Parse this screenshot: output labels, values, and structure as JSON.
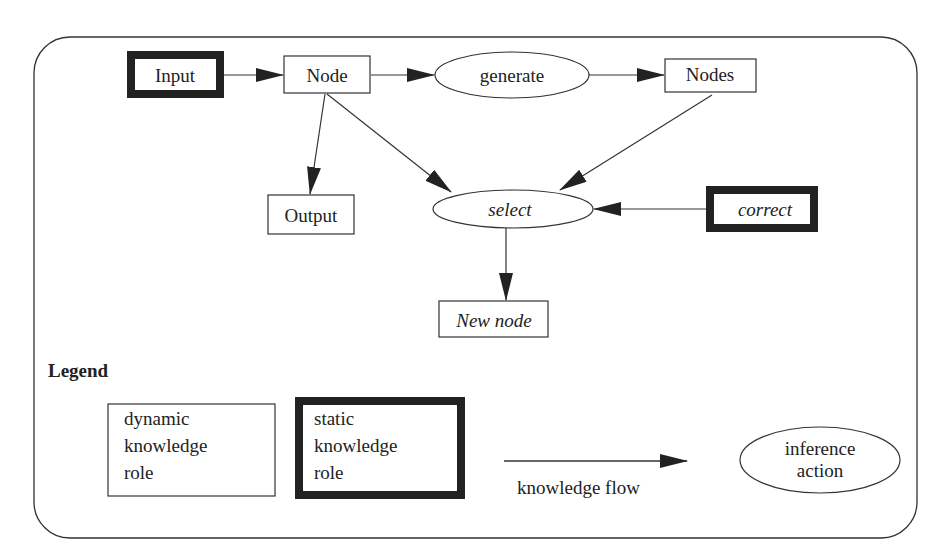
{
  "diagram": {
    "type": "inference-structure",
    "nodes": [
      {
        "id": "input",
        "label": "Input",
        "kind": "static-knowledge-role",
        "shape": "thick-rect",
        "italic": false
      },
      {
        "id": "node",
        "label": "Node",
        "kind": "dynamic-knowledge-role",
        "shape": "rect",
        "italic": false
      },
      {
        "id": "generate",
        "label": "generate",
        "kind": "inference-action",
        "shape": "ellipse",
        "italic": false
      },
      {
        "id": "nodes",
        "label": "Nodes",
        "kind": "dynamic-knowledge-role",
        "shape": "rect",
        "italic": false
      },
      {
        "id": "output",
        "label": "Output",
        "kind": "dynamic-knowledge-role",
        "shape": "rect",
        "italic": false
      },
      {
        "id": "select",
        "label": "select",
        "kind": "inference-action",
        "shape": "ellipse",
        "italic": true
      },
      {
        "id": "correct",
        "label": "correct",
        "kind": "static-knowledge-role",
        "shape": "thick-rect",
        "italic": true
      },
      {
        "id": "new_node",
        "label": "New node",
        "kind": "dynamic-knowledge-role",
        "shape": "rect",
        "italic": true
      }
    ],
    "edges": [
      {
        "from": "input",
        "to": "node"
      },
      {
        "from": "node",
        "to": "generate"
      },
      {
        "from": "generate",
        "to": "nodes"
      },
      {
        "from": "node",
        "to": "output"
      },
      {
        "from": "node",
        "to": "select"
      },
      {
        "from": "nodes",
        "to": "select"
      },
      {
        "from": "correct",
        "to": "select"
      },
      {
        "from": "select",
        "to": "new_node"
      }
    ]
  },
  "legend": {
    "title": "Legend",
    "dynamic_role": {
      "line1": "dynamic",
      "line2": "knowledge",
      "line3": "role"
    },
    "static_role": {
      "line1": "static",
      "line2": "knowledge",
      "line3": "role"
    },
    "flow_label": "knowledge flow",
    "inference": {
      "line1": "inference",
      "line2": "action"
    }
  },
  "colors": {
    "stroke": "#2a2a2a",
    "background": "#ffffff"
  }
}
